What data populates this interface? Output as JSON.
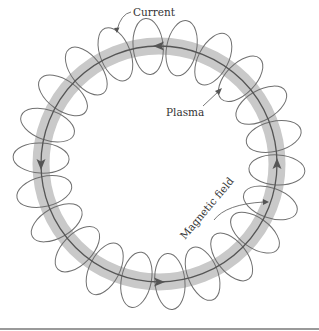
{
  "figure": {
    "labels": {
      "current": "Current",
      "plasma": "Plasma",
      "magnetic_field": "Magnetic field"
    },
    "colors": {
      "plasma_band": "#c9c9c9",
      "field_lines": "#707070",
      "current_line": "#555555",
      "text": "#333333",
      "rule": "#9a9a9a"
    },
    "geometry": {
      "center_x": 159,
      "center_y": 164,
      "ring_radius": 118,
      "band_width": 17,
      "loop_count": 22,
      "loop_radial_half": 28,
      "loop_tangential_half": 15
    },
    "current_direction": "counter-clockwise",
    "current_arrow_positions": [
      "top",
      "left",
      "bottom",
      "right"
    ]
  }
}
